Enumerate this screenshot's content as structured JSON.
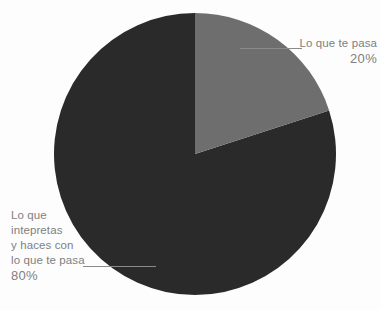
{
  "chart_data": {
    "type": "pie",
    "title": "",
    "subtitle": "",
    "xlabel": "",
    "ylabel": "",
    "legend_position": "callout-labels",
    "grid": false,
    "background_color": "#fdfdfd",
    "total": 100,
    "units": "%",
    "start_angle_deg": 0,
    "direction": "clockwise",
    "center": {
      "x": 195,
      "y": 154
    },
    "radius": 141,
    "categories": [
      "Lo que te pasa",
      "Lo que intepretas y haces con lo que te pasa"
    ],
    "values": [
      20,
      80
    ],
    "slices": [
      {
        "label": "Lo que te pasa",
        "label_lines": [
          "Lo que te pasa"
        ],
        "value": 20,
        "value_text": "20%",
        "color": "#6e6e6e",
        "start_angle_deg": 0,
        "end_angle_deg": 72,
        "callout_side": "top-right"
      },
      {
        "label": "Lo que intepretas y haces con lo que te pasa",
        "label_lines": [
          "Lo que",
          "intepretas",
          "y haces con",
          "lo que te pasa"
        ],
        "value": 80,
        "value_text": "80%",
        "color": "#2a2a2a",
        "start_angle_deg": 72,
        "end_angle_deg": 360,
        "callout_side": "bottom-left"
      }
    ]
  },
  "colors": {
    "slice_gray": "#6e6e6e",
    "slice_dark": "#2a2a2a",
    "label_text": "#808080",
    "leader_line": "#8a8a8a",
    "background": "#fdfdfd"
  },
  "labels": {
    "gray": {
      "line1": "Lo que te pasa",
      "percent": "20%"
    },
    "dark": {
      "line1": "Lo que",
      "line2": "intepretas",
      "line3": "y haces con",
      "line4": "lo que te pasa",
      "percent": "80%"
    }
  }
}
